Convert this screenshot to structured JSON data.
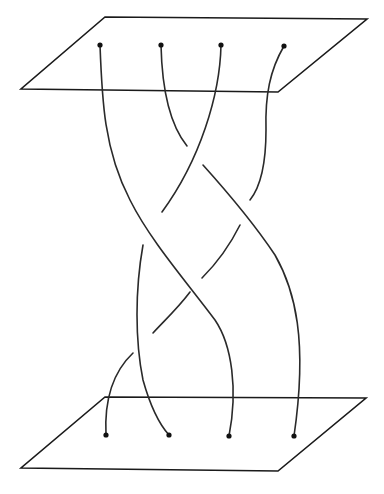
{
  "figure": {
    "type": "braid-diagram",
    "colors": {
      "line": "#1a1a1a",
      "background": "#ffffff"
    },
    "top_plane": {
      "points": "105,17 367,19 278,92 21,89"
    },
    "bottom_plane": {
      "points": "105,397 366,398 278,471 21,468"
    },
    "top_endpoints": [
      {
        "x": 100,
        "y": 45
      },
      {
        "x": 161,
        "y": 45
      },
      {
        "x": 221,
        "y": 45
      },
      {
        "x": 284,
        "y": 46
      }
    ],
    "bottom_endpoints": [
      {
        "x": 106,
        "y": 435
      },
      {
        "x": 169,
        "y": 435
      },
      {
        "x": 229,
        "y": 436
      },
      {
        "x": 294,
        "y": 436
      }
    ],
    "strand_segments": [
      "M100,45 C102,100 104,150 130,200 C150,240 185,280 215,320 C232,345 238,390 229,436",
      "M161,45 C162,90 170,125 187,146",
      "M203,165 C230,195 255,225 275,255 C295,290 308,340 294,436",
      "M221,45 C220,95 200,160 162,212",
      "M143,245 C135,290 135,340 143,380 C150,405 160,425 169,435",
      "M284,46 C270,70 265,95 266,130 C266,160 262,185 250,200",
      "M240,225 C230,245 218,262 202,278",
      "M190,292 C178,308 165,320 153,333",
      "M133,353 C115,370 104,395 106,435"
    ]
  }
}
